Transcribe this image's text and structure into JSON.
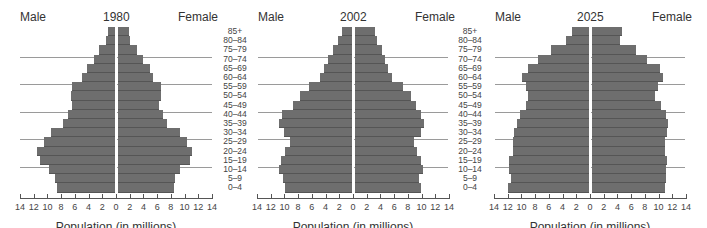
{
  "chart_data": [
    {
      "type": "bar",
      "subtype": "population-pyramid",
      "title": "1980",
      "left_label": "Male",
      "right_label": "Female",
      "xlabel": "Population (in millions)",
      "categories": [
        "85+",
        "80–84",
        "75–79",
        "70–74",
        "65–69",
        "60–64",
        "55–59",
        "50–54",
        "45–49",
        "40–44",
        "35–39",
        "30–34",
        "25–29",
        "20–24",
        "15–19",
        "10–14",
        "5–9",
        "0–4"
      ],
      "series": [
        {
          "name": "Male",
          "values": [
            1.0,
            1.3,
            2.3,
            3.1,
            4.1,
            4.8,
            6.2,
            6.4,
            6.3,
            6.8,
            7.6,
            9.4,
            10.4,
            11.3,
            11.0,
            9.6,
            8.7,
            8.5
          ]
        },
        {
          "name": "Female",
          "values": [
            1.6,
            1.7,
            2.8,
            3.7,
            4.7,
            5.1,
            6.3,
            6.2,
            6.0,
            6.6,
            7.1,
            9.0,
            10.0,
            10.8,
            10.5,
            9.0,
            8.3,
            8.1
          ]
        }
      ],
      "xticks": [
        14,
        12,
        10,
        8,
        6,
        4,
        2,
        0,
        2,
        4,
        6,
        8,
        10,
        12,
        14
      ],
      "xlim": [
        -14,
        14
      ],
      "grid": false
    },
    {
      "type": "bar",
      "subtype": "population-pyramid",
      "title": "2002",
      "left_label": "Male",
      "right_label": "Female",
      "xlabel": "Population (in millions)",
      "categories": [
        "85+",
        "80–84",
        "75–79",
        "70–74",
        "65–69",
        "60–64",
        "55–59",
        "50–54",
        "45–49",
        "40–44",
        "35–39",
        "30–34",
        "25–29",
        "20–24",
        "15–19",
        "10–14",
        "5–9",
        "0–4"
      ],
      "series": [
        {
          "name": "Male",
          "values": [
            1.4,
            2.0,
            2.8,
            3.5,
            4.1,
            4.6,
            6.2,
            7.6,
            8.6,
            10.2,
            10.6,
            9.9,
            9.0,
            9.8,
            10.4,
            10.7,
            10.1,
            9.8
          ]
        },
        {
          "name": "Female",
          "values": [
            2.9,
            3.2,
            3.9,
            4.4,
            4.8,
            5.4,
            7.0,
            8.2,
            8.9,
            9.6,
            10.0,
            9.6,
            8.6,
            9.1,
            9.6,
            9.9,
            9.4,
            9.6
          ]
        }
      ],
      "xticks": [
        14,
        12,
        10,
        8,
        6,
        4,
        2,
        0,
        2,
        4,
        6,
        8,
        10,
        12,
        14
      ],
      "xlim": [
        -14,
        14
      ],
      "grid": false
    },
    {
      "type": "bar",
      "subtype": "population-pyramid",
      "title": "2025",
      "left_label": "Male",
      "right_label": "Female",
      "xlabel": "Population (in millions)",
      "categories": [
        "85+",
        "80–84",
        "75–79",
        "70–74",
        "65–69",
        "60–64",
        "55–59",
        "50–54",
        "45–49",
        "40–44",
        "35–39",
        "30–34",
        "25–29",
        "20–24",
        "15–19",
        "10–14",
        "5–9",
        "0–4"
      ],
      "series": [
        {
          "name": "Male",
          "values": [
            2.5,
            3.3,
            5.6,
            7.4,
            8.9,
            9.7,
            9.2,
            8.9,
            9.2,
            10.1,
            10.5,
            10.9,
            11.1,
            11.1,
            11.7,
            11.6,
            11.4,
            11.8
          ]
        },
        {
          "name": "Female",
          "values": [
            4.4,
            4.1,
            6.4,
            8.0,
            9.9,
            10.4,
            9.6,
            9.2,
            10.0,
            10.8,
            11.1,
            11.0,
            10.6,
            10.7,
            10.9,
            10.8,
            10.8,
            10.7
          ]
        }
      ],
      "xticks": [
        14,
        12,
        10,
        8,
        6,
        4,
        2,
        0,
        2,
        4,
        6,
        8,
        10,
        12,
        14
      ],
      "xlim": [
        -14,
        14
      ],
      "grid": false
    }
  ],
  "panels": [
    {
      "title": "1980",
      "male": "Male",
      "female": "Female",
      "xlabel": "Population (in millions)"
    },
    {
      "title": "2002",
      "male": "Male",
      "female": "Female",
      "xlabel": "Population (in millions)"
    },
    {
      "title": "2025",
      "male": "Male",
      "female": "Female",
      "xlabel": "Population (in millions)"
    }
  ],
  "age_groups": [
    "85+",
    "80–84",
    "75–79",
    "70–74",
    "65–69",
    "60–64",
    "55–59",
    "50–54",
    "45–49",
    "40–44",
    "35–39",
    "30–34",
    "25–29",
    "20–24",
    "15–19",
    "10–14",
    "5–9",
    "0–4"
  ],
  "tick_labels": [
    "14",
    "12",
    "10",
    "8",
    "6",
    "4",
    "2",
    "0",
    "2",
    "4",
    "6",
    "8",
    "10",
    "12",
    "14"
  ],
  "colors": {
    "bar": "#6e6e6e",
    "guide": "#9a9a9a",
    "axis": "#555555"
  }
}
